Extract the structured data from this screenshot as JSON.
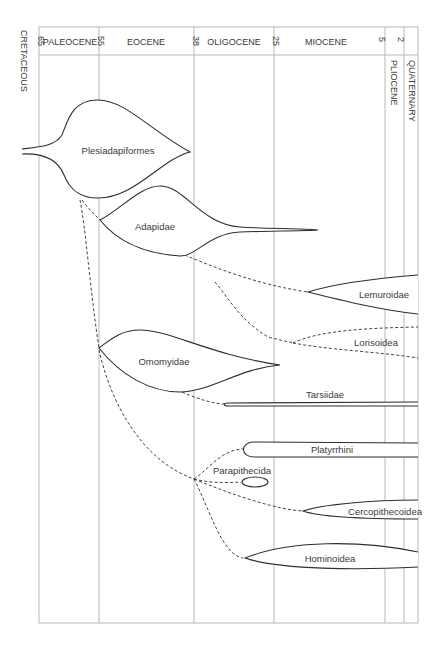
{
  "figure": {
    "type": "phylogenetic-timeline"
  },
  "timescale": {
    "unit": "million years ago",
    "ticks": [
      {
        "value": "65",
        "x": 39
      },
      {
        "value": "55",
        "x": 99
      },
      {
        "value": "38",
        "x": 194
      },
      {
        "value": "25",
        "x": 274
      },
      {
        "value": "5",
        "x": 385
      },
      {
        "value": "2",
        "x": 404
      }
    ],
    "epochs_horizontal": [
      {
        "label": "PALEOCENE",
        "cx": 69
      },
      {
        "label": "EOCENE",
        "cx": 146
      },
      {
        "label": "OLIGOCENE",
        "cx": 234
      },
      {
        "label": "MIOCENE",
        "cx": 326
      }
    ],
    "epochs_vertical": [
      {
        "label": "CRETACEOUS",
        "x": 24,
        "y": 30
      },
      {
        "label": "PLIOCENE",
        "x": 394,
        "y": 60
      },
      {
        "label": "QUATERNARY",
        "x": 411,
        "y": 60
      }
    ]
  },
  "taxa": [
    {
      "name": "Plesiadapiformes",
      "label_x": 118,
      "label_y": 151
    },
    {
      "name": "Adapidae",
      "label_x": 155,
      "label_y": 228
    },
    {
      "name": "Lemuroidae",
      "label_x": 384,
      "label_y": 297
    },
    {
      "name": "Lorisoidea",
      "label_x": 376,
      "label_y": 345
    },
    {
      "name": "Omomyidae",
      "label_x": 164,
      "label_y": 364
    },
    {
      "name": "Tarsiidae",
      "label_x": 325,
      "label_y": 397
    },
    {
      "name": "Platyrrhini",
      "label_x": 332,
      "label_y": 453
    },
    {
      "name": "Parapithecida",
      "label_x": 242,
      "label_y": 473
    },
    {
      "name": "Cercopithecoidea",
      "label_x": 386,
      "label_y": 514
    },
    {
      "name": "Hominoidea",
      "label_x": 330,
      "label_y": 561
    }
  ],
  "colors": {
    "line": "#2e2e2e",
    "grid": "#b8b8b8",
    "text": "#3a3a3a",
    "background": "#ffffff"
  }
}
